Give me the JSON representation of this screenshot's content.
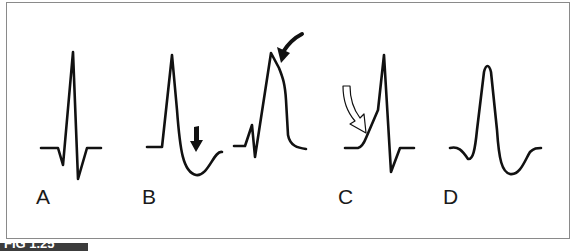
{
  "figure": {
    "caption_fragment": "FIG 1.25",
    "panels": [
      {
        "label": "A",
        "description": "Normal QRS complex"
      },
      {
        "label": "B",
        "description": "Two waveforms with arrows: deep downward ST/T (solid down arrow) and tall peaked complex with shoulder (solid curved arrow)"
      },
      {
        "label": "C",
        "description": "Slurred upstroke / delta wave (hollow curved arrow)"
      },
      {
        "label": "D",
        "description": "Wide rounded complex"
      }
    ]
  },
  "colors": {
    "stroke": "#111111",
    "frame": "#8a8a8a",
    "caption_bar": "#3c3c3c"
  }
}
